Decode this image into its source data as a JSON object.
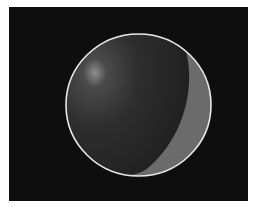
{
  "figure": {
    "colors": {
      "background": "#0e0e0e",
      "sphere_dark": "#2a2a2a",
      "highlight": "#8a8a8a",
      "crescent": "#6a6a6a",
      "outline": "#e8e8e8"
    }
  }
}
